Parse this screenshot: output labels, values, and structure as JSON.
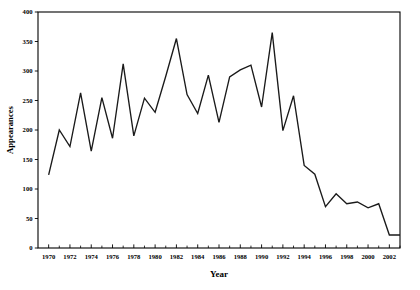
{
  "chart_data": {
    "type": "line",
    "title": "",
    "xlabel": "Year",
    "ylabel": "Appearances",
    "xlim": [
      1969,
      2003
    ],
    "ylim": [
      0,
      400
    ],
    "grid": false,
    "legend": null,
    "y_ticks": [
      0,
      50,
      100,
      150,
      200,
      250,
      300,
      350,
      400
    ],
    "y_tick_labels": [
      "0",
      "50",
      "100",
      "150",
      "200",
      "250",
      "300",
      "350",
      "400"
    ],
    "x_ticks": [
      1970,
      1972,
      1974,
      1976,
      1978,
      1980,
      1982,
      1984,
      1986,
      1988,
      1990,
      1992,
      1994,
      1996,
      1998,
      2000,
      2002
    ],
    "x_tick_labels": [
      "1970",
      "1972",
      "1974",
      "1976",
      "1978",
      "1980",
      "1982",
      "1984",
      "1986",
      "1988",
      "1990",
      "1992",
      "1994",
      "1996",
      "1998",
      "2000",
      "2002"
    ],
    "x_minor_tick_years": [
      1971,
      1973,
      1975,
      1977,
      1979,
      1981,
      1983,
      1985,
      1987,
      1989,
      1991,
      1993,
      1995,
      1997,
      1999,
      2001,
      2003
    ],
    "series_color": "#1a1a1a",
    "x": [
      1970,
      1971,
      1972,
      1973,
      1974,
      1975,
      1976,
      1977,
      1978,
      1979,
      1980,
      1981,
      1982,
      1983,
      1984,
      1985,
      1986,
      1987,
      1988,
      1989,
      1990,
      1991,
      1992,
      1993,
      1994,
      1995,
      1996,
      1997,
      1998,
      1999,
      2000,
      2001,
      2002,
      2003
    ],
    "values": [
      124,
      200,
      172,
      263,
      164,
      255,
      186,
      312,
      190,
      254,
      230,
      291,
      355,
      260,
      228,
      293,
      213,
      290,
      302,
      310,
      239,
      365,
      199,
      258,
      140,
      125,
      70,
      92,
      75,
      78,
      68,
      75,
      22,
      22
    ]
  },
  "axes": {
    "ylabel": "Appearances",
    "xlabel": "Year"
  }
}
